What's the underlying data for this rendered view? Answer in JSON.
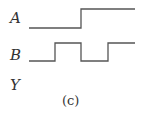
{
  "figure": {
    "caption": "(c)",
    "signals": [
      {
        "name": "A",
        "levels": [
          0,
          0,
          1,
          1
        ]
      },
      {
        "name": "B",
        "levels": [
          0,
          1,
          0,
          1
        ]
      },
      {
        "name": "Y",
        "levels": []
      }
    ],
    "line_color": "#555555"
  }
}
